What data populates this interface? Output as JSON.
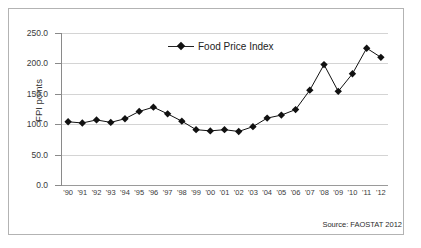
{
  "chart_data": {
    "type": "line",
    "title": "",
    "xlabel": "",
    "ylabel": "FPI points",
    "ylim": [
      0,
      250
    ],
    "yticks": [
      0,
      50,
      100,
      150,
      200,
      250
    ],
    "ytick_labels": [
      "0.0",
      "50.0",
      "100.0",
      "150.0",
      "200.0",
      "250.0"
    ],
    "grid": true,
    "legend_position": "top-center",
    "categories": [
      "'90",
      "'91",
      "'92",
      "'93",
      "'94",
      "'95",
      "'96",
      "'97",
      "'98",
      "'99",
      "'00",
      "'01",
      "'02",
      "'03",
      "'04",
      "'05",
      "'06",
      "'07",
      "'08",
      "'09",
      "'10",
      "'11",
      "'12"
    ],
    "series": [
      {
        "name": "Food Price Index",
        "marker": "diamond",
        "color": "#111111",
        "values": [
          104,
          102,
          107,
          103,
          109,
          121,
          128,
          117,
          105,
          91,
          89,
          91,
          88,
          96,
          110,
          115,
          124,
          156,
          198,
          154,
          183,
          225,
          210
        ]
      }
    ],
    "annotations": [
      "Source: FAOSTAT 2012"
    ]
  },
  "legend": {
    "items": [
      {
        "label": "Food Price Index"
      }
    ]
  },
  "source_note": "Source: FAOSTAT 2012"
}
